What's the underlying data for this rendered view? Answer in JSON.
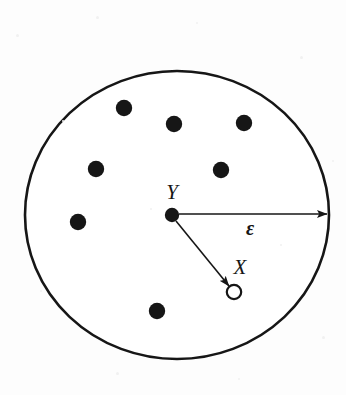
{
  "figure": {
    "kind": "epsilon-neighborhood-diagram",
    "background_color": "#fdfdfd",
    "ink_color": "#161616",
    "width": 346,
    "height": 395,
    "boundary": {
      "shape": "ellipse",
      "cx": 177,
      "cy": 215,
      "rx": 152,
      "ry": 144,
      "stroke_width": 2.6,
      "fill": "#ffffff"
    },
    "labels": {
      "center_point": "Y",
      "sample_point": "X",
      "radius": "ε"
    },
    "label_positions": {
      "center_point": {
        "x": 172,
        "y": 194
      },
      "sample_point": {
        "x": 240,
        "y": 269
      },
      "radius": {
        "x": 250,
        "y": 230
      }
    },
    "center_marker": {
      "label": "Y",
      "cx": 172,
      "cy": 215,
      "r": 7.2,
      "fill": "#161616",
      "style": "filled"
    },
    "sample_marker": {
      "label": "X",
      "cx": 234,
      "cy": 292,
      "r": 7.2,
      "fill": "#ffffff",
      "stroke": "#161616",
      "stroke_width": 2.2,
      "style": "open"
    },
    "arrows": [
      {
        "name": "radius-arrow",
        "label": "ε",
        "x1": 179,
        "y1": 214,
        "x2": 327,
        "y2": 214,
        "stroke_width": 1.6
      },
      {
        "name": "sample-arrow",
        "label": "X",
        "x1": 176,
        "y1": 221,
        "x2": 229,
        "y2": 286,
        "stroke_width": 1.6
      }
    ],
    "population_points": [
      {
        "cx": 124,
        "cy": 108,
        "r": 8.2
      },
      {
        "cx": 174,
        "cy": 124,
        "r": 8.2
      },
      {
        "cx": 244,
        "cy": 123,
        "r": 8.2
      },
      {
        "cx": 96,
        "cy": 169,
        "r": 8.2
      },
      {
        "cx": 221,
        "cy": 170,
        "r": 8.2
      },
      {
        "cx": 78,
        "cy": 222,
        "r": 8.2
      },
      {
        "cx": 157,
        "cy": 311,
        "r": 8.2
      }
    ],
    "speckles": [
      {
        "x": 16,
        "y": 34,
        "d": 3
      },
      {
        "x": 96,
        "y": 16,
        "d": 3
      },
      {
        "x": 196,
        "y": 22,
        "d": 2
      },
      {
        "x": 300,
        "y": 56,
        "d": 3
      },
      {
        "x": 332,
        "y": 160,
        "d": 2
      },
      {
        "x": 40,
        "y": 290,
        "d": 2
      },
      {
        "x": 116,
        "y": 372,
        "d": 3
      },
      {
        "x": 238,
        "y": 378,
        "d": 2
      },
      {
        "x": 322,
        "y": 336,
        "d": 3
      },
      {
        "x": 62,
        "y": 120,
        "d": 2
      },
      {
        "x": 280,
        "y": 244,
        "d": 2
      },
      {
        "x": 150,
        "y": 208,
        "d": 2
      }
    ]
  }
}
